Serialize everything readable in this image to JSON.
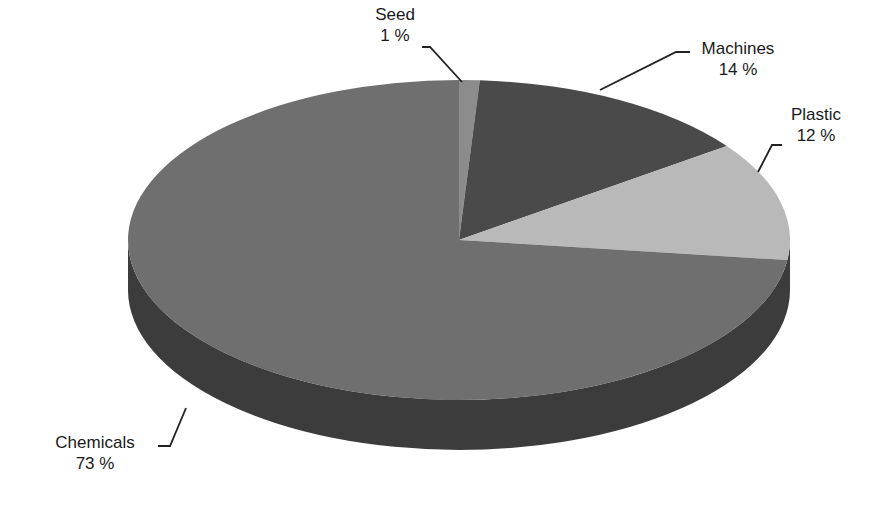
{
  "chart_data": {
    "type": "pie",
    "style": "3d",
    "title": "",
    "categories": [
      "Seed",
      "Machines",
      "Plastic",
      "Chemicals"
    ],
    "values": [
      1,
      14,
      12,
      73
    ],
    "unit": "%",
    "colors": {
      "Seed": "#8c8c8c",
      "Machines": "#4a4a4a",
      "Plastic": "#b9b9b9",
      "Chemicals": "#6f6f6f",
      "side": "#3a3a3a"
    },
    "labels": [
      {
        "name": "Seed",
        "value": "1 %"
      },
      {
        "name": "Machines",
        "value": "14 %"
      },
      {
        "name": "Plastic",
        "value": "12 %"
      },
      {
        "name": "Chemicals",
        "value": "73 %"
      }
    ],
    "legend": "none"
  }
}
